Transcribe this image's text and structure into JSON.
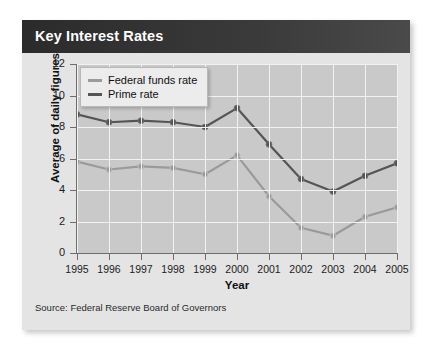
{
  "card": {
    "title": "Key Interest Rates",
    "source": "Source: Federal Reserve Board of Governors"
  },
  "colors": {
    "title_bar": "#2b2b2b",
    "plot_background": "#c9c9c9",
    "card_background": "#e4e4e4",
    "gridline": "#f2f2f2",
    "axis": "#6d6d6d",
    "federal_funds_rate": "#9a9a9a",
    "prime_rate": "#555555"
  },
  "legend": {
    "position": "top-left-inside",
    "items": [
      {
        "label": "Federal funds rate",
        "color": "#9a9a9a"
      },
      {
        "label": "Prime rate",
        "color": "#555555"
      }
    ]
  },
  "axes": {
    "y_ticks": [
      "0",
      "2",
      "4",
      "6",
      "8",
      "10",
      "12"
    ],
    "x_ticks": [
      "1995",
      "1996",
      "1997",
      "1998",
      "1999",
      "2000",
      "2001",
      "2002",
      "2003",
      "2004",
      "2005"
    ],
    "ylabel": "Average of daily figures",
    "xlabel": "Year"
  },
  "chart_data": {
    "type": "line",
    "title": "Key Interest Rates",
    "subtitle": "",
    "xlabel": "Year",
    "ylabel": "Average of daily figures",
    "x": [
      1995,
      1996,
      1997,
      1998,
      1999,
      2000,
      2001,
      2002,
      2003,
      2004,
      2005
    ],
    "categories": [
      "1995",
      "1996",
      "1997",
      "1998",
      "1999",
      "2000",
      "2001",
      "2002",
      "2003",
      "2004",
      "2005"
    ],
    "series": [
      {
        "name": "Federal funds rate",
        "color": "#9a9a9a",
        "values": [
          5.8,
          5.3,
          5.5,
          5.4,
          5.0,
          6.2,
          3.6,
          1.6,
          1.1,
          2.3,
          2.9
        ]
      },
      {
        "name": "Prime rate",
        "color": "#555555",
        "values": [
          8.8,
          8.3,
          8.4,
          8.3,
          8.0,
          9.2,
          6.9,
          4.7,
          3.9,
          4.9,
          5.7
        ]
      }
    ],
    "xlim": [
      1995,
      2005
    ],
    "ylim": [
      0,
      12
    ],
    "ytick_interval": 2,
    "grid": true,
    "legend_position": "top-left",
    "annotations": [
      "Source: Federal Reserve Board of Governors"
    ]
  }
}
